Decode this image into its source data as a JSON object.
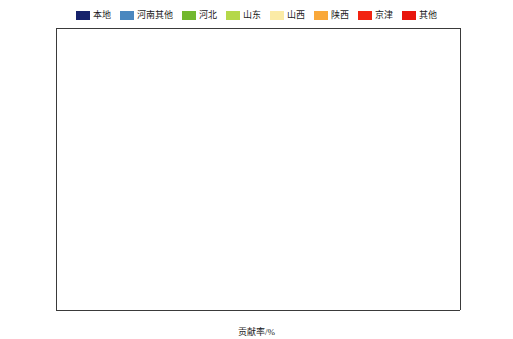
{
  "chart_data": {
    "type": "bar",
    "orientation": "horizontal",
    "stacked": true,
    "normalized": true,
    "title": "",
    "xlabel": "贡献率/%",
    "ylabel": "",
    "xlim": [
      0,
      100
    ],
    "xticks": [
      0,
      10,
      20,
      30,
      40,
      50,
      60,
      70,
      80,
      90,
      100
    ],
    "grid": false,
    "legend_position": "top-center",
    "legend": [
      "本地",
      "河南其他",
      "河北",
      "山东",
      "山西",
      "陕西",
      "京津",
      "其他"
    ],
    "series_colors": {
      "本地": "#16226b",
      "河南其他": "#4a87bf",
      "河北": "#73b82e",
      "山东": "#b5d84a",
      "山西": "#fbeba6",
      "陕西": "#f9a83a",
      "京津": "#f22311",
      "其他": "#e8160d"
    },
    "panels": [
      {
        "name": "PM2.5",
        "label_html": "PM<sub>2.5</sub>",
        "categories": [
          "郑州",
          "开封",
          "安阳",
          "鹤壁",
          "新乡",
          "焦作",
          "濮阳",
          "洛阳",
          "三门峡"
        ],
        "series": [
          {
            "name": "本地",
            "values": [
              55.5,
              41.0,
              33.5,
              32.0,
              38.5,
              41.0,
              28.5,
              39.0,
              20.5
            ]
          },
          {
            "name": "河南其他",
            "values": [
              20.5,
              28.5,
              29.0,
              31.0,
              23.5,
              25.0,
              31.5,
              27.0,
              29.0
            ]
          },
          {
            "name": "河北",
            "values": [
              3.0,
              6.5,
              13.5,
              10.5,
              9.0,
              4.5,
              15.0,
              4.0,
              4.0
            ]
          },
          {
            "name": "山东",
            "values": [
              3.0,
              3.0,
              3.5,
              3.5,
              3.5,
              4.0,
              3.5,
              2.5,
              2.0
            ]
          },
          {
            "name": "山西",
            "values": [
              8.5,
              10.0,
              10.5,
              13.0,
              12.0,
              13.0,
              10.5,
              13.5,
              16.0
            ]
          },
          {
            "name": "陕西",
            "values": [
              3.5,
              3.0,
              2.5,
              2.5,
              3.5,
              4.5,
              2.5,
              6.5,
              22.0
            ]
          },
          {
            "name": "京津",
            "values": [
              1.0,
              1.5,
              2.0,
              2.0,
              1.5,
              1.5,
              2.0,
              1.0,
              1.0
            ]
          },
          {
            "name": "其他",
            "values": [
              5.0,
              6.5,
              5.5,
              5.5,
              8.5,
              6.5,
              6.5,
              6.5,
              5.5
            ]
          }
        ]
      },
      {
        "name": "SIA",
        "label_html": "SIA",
        "categories": [
          "郑州",
          "开封",
          "安阳",
          "鹤壁",
          "新乡",
          "焦作",
          "濮阳",
          "洛阳",
          "三门峡"
        ],
        "series": [
          {
            "name": "本地",
            "values": [
              35.0,
              22.5,
              26.0,
              25.5,
              31.0,
              32.0,
              23.0,
              29.5,
              30.0
            ]
          },
          {
            "name": "河南其他",
            "values": [
              30.0,
              33.5,
              23.5,
              26.5,
              25.5,
              22.5,
              23.0,
              22.5,
              10.0
            ]
          },
          {
            "name": "河北",
            "values": [
              5.5,
              11.0,
              20.0,
              14.5,
              13.0,
              6.5,
              18.5,
              4.5,
              1.5
            ]
          },
          {
            "name": "山东",
            "values": [
              4.0,
              5.5,
              3.5,
              4.5,
              4.0,
              4.0,
              6.0,
              3.0,
              1.5
            ]
          },
          {
            "name": "山西",
            "values": [
              11.5,
              9.5,
              13.5,
              16.0,
              12.0,
              17.0,
              12.5,
              19.0,
              23.0
            ]
          },
          {
            "name": "陕西",
            "values": [
              4.0,
              4.5,
              3.0,
              3.0,
              4.5,
              6.0,
              3.5,
              8.5,
              21.0
            ]
          },
          {
            "name": "京津",
            "values": [
              2.0,
              3.0,
              3.0,
              2.5,
              2.5,
              2.0,
              3.0,
              1.5,
              1.0
            ]
          },
          {
            "name": "其他",
            "values": [
              8.0,
              10.5,
              7.5,
              7.5,
              7.5,
              10.0,
              10.5,
              11.5,
              12.0
            ]
          }
        ]
      },
      {
        "name": "PPM",
        "label_html": "PPM",
        "categories": [
          "郑州",
          "开封",
          "安阳",
          "鹤壁",
          "新乡",
          "焦作",
          "濮阳",
          "洛阳",
          "三门峡"
        ],
        "series": [
          {
            "name": "本地",
            "values": [
              75.5,
              43.5,
              57.5,
              56.0,
              66.5,
              68.5,
              55.0,
              71.0,
              46.5
            ]
          },
          {
            "name": "河南其他",
            "values": [
              18.0,
              27.5,
              20.5,
              25.5,
              21.5,
              13.0,
              22.5,
              13.0,
              7.5
            ]
          },
          {
            "name": "河北",
            "values": [
              1.5,
              6.5,
              7.5,
              2.0,
              1.5,
              1.5,
              7.5,
              1.5,
              0.5
            ]
          },
          {
            "name": "山东",
            "values": [
              1.0,
              2.5,
              1.0,
              1.5,
              1.0,
              1.0,
              2.5,
              1.0,
              0.5
            ]
          },
          {
            "name": "山西",
            "values": [
              2.0,
              15.5,
              9.5,
              11.0,
              6.5,
              9.5,
              9.0,
              8.0,
              8.5
            ]
          },
          {
            "name": "陕西",
            "values": [
              0.7,
              1.0,
              1.5,
              1.5,
              1.0,
              4.5,
              1.0,
              3.0,
              29.0
            ]
          },
          {
            "name": "京津",
            "values": [
              0.3,
              0.5,
              0.5,
              0.5,
              0.5,
              0.5,
              0.5,
              0.5,
              0.5
            ]
          },
          {
            "name": "其他",
            "values": [
              1.0,
              3.0,
              2.0,
              2.0,
              1.5,
              1.5,
              2.0,
              2.0,
              7.0
            ]
          }
        ]
      }
    ]
  }
}
